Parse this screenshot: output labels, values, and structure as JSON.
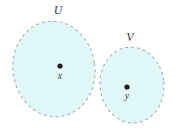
{
  "figure": {
    "type": "set-diagram",
    "background_color": "#ffffff",
    "width": 178,
    "height": 134,
    "region_fill_color": "#e1f8f8",
    "region_stroke_color": "#9aa8b4",
    "point_color": "#1a1a1a",
    "label_color": "#3a3a3a",
    "sets": [
      {
        "name": "set-u",
        "label": "U",
        "label_x": 58,
        "label_y": 14,
        "center_x": 54,
        "center_y": 69,
        "radius_x": 41,
        "radius_y": 48,
        "rotation": -8,
        "point": {
          "name": "point-x",
          "label": "x",
          "cx": 60,
          "cy": 66,
          "r": 2.6,
          "label_x": 60,
          "label_y": 79
        }
      },
      {
        "name": "set-v",
        "label": "V",
        "label_x": 130,
        "label_y": 41,
        "center_x": 132,
        "center_y": 85,
        "radius_x": 32,
        "radius_y": 38,
        "rotation": -6,
        "point": {
          "name": "point-y",
          "label": "y",
          "cx": 127,
          "cy": 87,
          "r": 2.6,
          "label_x": 127,
          "label_y": 99
        }
      }
    ],
    "stroke_dash": "3 3",
    "stroke_width": 1
  }
}
